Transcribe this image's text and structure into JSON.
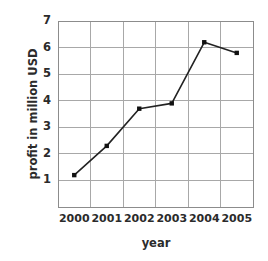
{
  "chart_data": {
    "type": "line",
    "title": "",
    "xlabel": "year",
    "ylabel": "profit in million USD",
    "categories": [
      "2000",
      "2001",
      "2002",
      "2003",
      "2004",
      "2005"
    ],
    "values": [
      1.2,
      2.3,
      3.7,
      3.9,
      6.2,
      5.8
    ],
    "series": [
      {
        "name": "profit",
        "values": [
          1.2,
          2.3,
          3.7,
          3.9,
          6.2,
          5.8
        ]
      }
    ],
    "ylim": [
      0,
      7
    ],
    "yticks": [
      1,
      2,
      3,
      4,
      5,
      6,
      7
    ],
    "ytick_labels": [
      "1",
      "2",
      "3",
      "4",
      "5",
      "6",
      "7"
    ],
    "grid": true,
    "legend": false,
    "legend_position": "none",
    "marker": "square",
    "line_color": "#222222",
    "marker_color": "#111111",
    "grid_color": "#a8a8a8",
    "axis_color": "#8c8c8c",
    "background_color": "#ffffff"
  }
}
